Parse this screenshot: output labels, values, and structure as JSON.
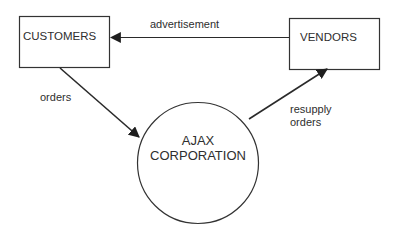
{
  "diagram": {
    "type": "context-diagram",
    "nodes": {
      "customers": {
        "label": "CUSTOMERS",
        "shape": "rectangle"
      },
      "vendors": {
        "label": "VENDORS",
        "shape": "rectangle"
      },
      "ajax": {
        "line1": "AJAX",
        "line2": "CORPORATION",
        "shape": "circle"
      }
    },
    "edges": {
      "advertisement": {
        "from": "VENDORS",
        "to": "CUSTOMERS",
        "label": "advertisement"
      },
      "orders": {
        "from": "CUSTOMERS",
        "to": "AJAX CORPORATION",
        "label": "orders"
      },
      "resupply": {
        "from": "AJAX CORPORATION",
        "to": "VENDORS",
        "line1": "resupply",
        "line2": "orders"
      }
    },
    "colors": {
      "stroke": "#333333",
      "text": "#2e2e2e",
      "background": "#ffffff"
    }
  }
}
